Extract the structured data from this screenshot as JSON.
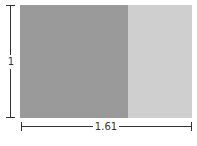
{
  "diagram": {
    "height_label": "1",
    "width_label": "1.61",
    "colors": {
      "major_rect": "#9a9a9a",
      "minor_rect": "#cfcfcf",
      "lines": "#333333"
    },
    "caption": ""
  }
}
